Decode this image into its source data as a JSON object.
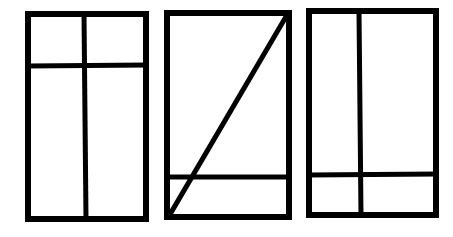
{
  "diagram": {
    "stroke_color": "#000000",
    "background": "#ffffff",
    "panels": [
      {
        "id": "panel-1",
        "frame": {
          "x1": 28,
          "y1": 14,
          "x2": 146,
          "y2": 219
        },
        "lines": [
          {
            "type": "horizontal",
            "x1": 28,
            "y1": 66,
            "x2": 146,
            "y2": 65
          },
          {
            "type": "vertical",
            "x1": 84,
            "y1": 14,
            "x2": 86,
            "y2": 219
          }
        ]
      },
      {
        "id": "panel-2",
        "frame": {
          "x1": 167,
          "y1": 13,
          "x2": 289,
          "y2": 217
        },
        "lines": [
          {
            "type": "horizontal",
            "x1": 167,
            "y1": 177,
            "x2": 289,
            "y2": 177
          },
          {
            "type": "diagonal",
            "x1": 169,
            "y1": 216,
            "x2": 287,
            "y2": 15
          }
        ]
      },
      {
        "id": "panel-3",
        "frame": {
          "x1": 309,
          "y1": 11,
          "x2": 436,
          "y2": 215
        },
        "lines": [
          {
            "type": "vertical",
            "x1": 359,
            "y1": 11,
            "x2": 361,
            "y2": 215
          },
          {
            "type": "horizontal",
            "x1": 309,
            "y1": 175,
            "x2": 436,
            "y2": 174
          }
        ]
      }
    ]
  }
}
